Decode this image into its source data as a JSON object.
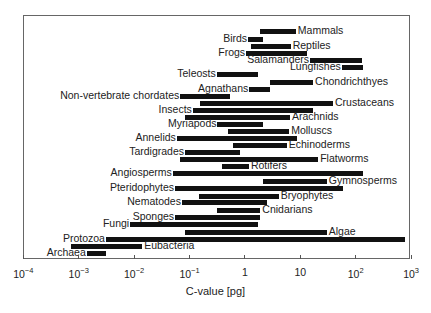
{
  "chart_data": {
    "type": "bar",
    "orientation": "horizontal-range",
    "title": "",
    "xlabel": "C-value [pg]",
    "ylabel": "",
    "xscale": "log",
    "xlim": [
      0.0001,
      1000
    ],
    "x_ticks": [
      {
        "value": 0.0001,
        "base": "10",
        "exp": "−4"
      },
      {
        "value": 0.001,
        "base": "10",
        "exp": "−3"
      },
      {
        "value": 0.01,
        "base": "10",
        "exp": "−2"
      },
      {
        "value": 0.1,
        "base": "10",
        "exp": "−1"
      },
      {
        "value": 1,
        "base": "1",
        "exp": ""
      },
      {
        "value": 10,
        "base": "10",
        "exp": ""
      },
      {
        "value": 100,
        "base": "10",
        "exp": "2"
      },
      {
        "value": 1000,
        "base": "10",
        "exp": "3"
      }
    ],
    "grid": false,
    "legend": null,
    "series": [
      {
        "name": "Mammals",
        "min": 1.9,
        "max": 8.3,
        "label_side": "right",
        "y": 31
      },
      {
        "name": "Birds",
        "min": 1.14,
        "max": 2.1,
        "label_side": "left",
        "y": 39
      },
      {
        "name": "Reptiles",
        "min": 1.3,
        "max": 6.7,
        "label_side": "right",
        "y": 46
      },
      {
        "name": "Frogs",
        "min": 1.05,
        "max": 13,
        "label_side": "left",
        "y": 53
      },
      {
        "name": "Salamanders",
        "min": 15,
        "max": 130,
        "label_side": "left",
        "y": 60
      },
      {
        "name": "Lungfishes",
        "min": 56,
        "max": 135,
        "label_side": "left",
        "y": 67
      },
      {
        "name": "Teleosts",
        "min": 0.31,
        "max": 1.7,
        "label_side": "left",
        "y": 74
      },
      {
        "name": "Chondrichthyes",
        "min": 2.8,
        "max": 17,
        "label_side": "right",
        "y": 82
      },
      {
        "name": "Agnathans",
        "min": 1.2,
        "max": 2.8,
        "label_side": "left",
        "y": 89
      },
      {
        "name": "Non-vertebrate chordates",
        "min": 0.068,
        "max": 0.54,
        "label_side": "left",
        "y": 96
      },
      {
        "name": "Crustaceans",
        "min": 0.155,
        "max": 39,
        "label_side": "right",
        "y": 103
      },
      {
        "name": "Insects",
        "min": 0.115,
        "max": 17,
        "label_side": "left",
        "y": 110
      },
      {
        "name": "Arachnids",
        "min": 0.083,
        "max": 6.5,
        "label_side": "right",
        "y": 117
      },
      {
        "name": "Myriapods",
        "min": 0.32,
        "max": 2.1,
        "label_side": "left",
        "y": 124
      },
      {
        "name": "Molluscs",
        "min": 0.5,
        "max": 6.3,
        "label_side": "right",
        "y": 131
      },
      {
        "name": "Annelids",
        "min": 0.059,
        "max": 8.7,
        "label_side": "left",
        "y": 138
      },
      {
        "name": "Echinoderms",
        "min": 0.61,
        "max": 5.7,
        "label_side": "right",
        "y": 145
      },
      {
        "name": "Tardigrades",
        "min": 0.083,
        "max": 0.81,
        "label_side": "left",
        "y": 152
      },
      {
        "name": "Flatworms",
        "min": 0.068,
        "max": 21,
        "label_side": "right",
        "y": 159
      },
      {
        "name": "Rotifers",
        "min": 0.39,
        "max": 1.18,
        "label_side": "right",
        "y": 166
      },
      {
        "name": "Angiosperms",
        "min": 0.05,
        "max": 135,
        "label_side": "left",
        "y": 173
      },
      {
        "name": "Gymnosperms",
        "min": 2.1,
        "max": 30,
        "label_side": "right",
        "y": 181
      },
      {
        "name": "Pteridophytes",
        "min": 0.055,
        "max": 59,
        "label_side": "left",
        "y": 188
      },
      {
        "name": "Bryophytes",
        "min": 0.15,
        "max": 4.1,
        "label_side": "right",
        "y": 196
      },
      {
        "name": "Nematodes",
        "min": 0.073,
        "max": 2.5,
        "label_side": "left",
        "y": 202
      },
      {
        "name": "Cnidarians",
        "min": 0.31,
        "max": 1.9,
        "label_side": "right",
        "y": 210
      },
      {
        "name": "Sponges",
        "min": 0.055,
        "max": 1.9,
        "label_side": "left",
        "y": 217
      },
      {
        "name": "Fungi",
        "min": 0.0085,
        "max": 1.7,
        "label_side": "left",
        "y": 224
      },
      {
        "name": "Algae",
        "min": 0.083,
        "max": 30,
        "label_side": "right",
        "y": 232
      },
      {
        "name": "Protozoa",
        "min": 0.0031,
        "max": 780,
        "label_side": "left",
        "y": 239
      },
      {
        "name": "Eubacteria",
        "min": 0.00073,
        "max": 0.014,
        "label_side": "right",
        "y": 246
      },
      {
        "name": "Archaea",
        "min": 0.0014,
        "max": 0.0031,
        "label_side": "left",
        "y": 253
      }
    ]
  }
}
